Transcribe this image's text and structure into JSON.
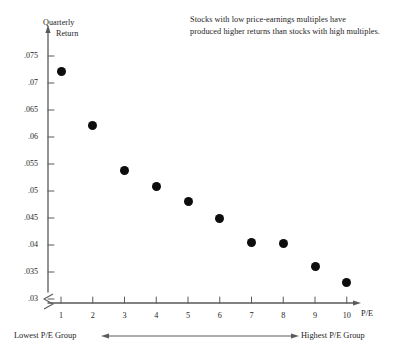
{
  "chart_data": {
    "type": "scatter",
    "title": "",
    "annotation": [
      "Stocks with low price-earnings multiples have",
      "produced higher returns than stocks with high multiples."
    ],
    "xlabel": "P/E",
    "ylabel_lines": [
      "Quarterly",
      "Return"
    ],
    "xlim": [
      0.4,
      10.8
    ],
    "ylim": [
      0.03,
      0.0775
    ],
    "yaxis_break": true,
    "grid": false,
    "legend": null,
    "xticks": [
      1,
      2,
      3,
      4,
      5,
      6,
      7,
      8,
      9,
      10
    ],
    "xtick_labels": [
      "1",
      "2",
      "3",
      "4",
      "5",
      "6",
      "7",
      "8",
      "9",
      "10"
    ],
    "yticks": [
      0.075,
      0.07,
      0.065,
      0.06,
      0.055,
      0.05,
      0.045,
      0.04,
      0.035,
      0.03
    ],
    "ytick_labels": [
      ".075",
      ".07",
      ".065",
      ".06",
      ".055",
      ".05",
      ".045",
      ".04",
      ".035",
      ".03"
    ],
    "x": [
      1,
      2,
      3,
      4,
      5,
      6,
      7,
      8,
      9,
      10
    ],
    "values": [
      0.0722,
      0.0621,
      0.0538,
      0.0509,
      0.0481,
      0.045,
      0.0404,
      0.0403,
      0.036,
      0.033
    ],
    "points": [
      {
        "x": 1,
        "y": 0.0722
      },
      {
        "x": 2,
        "y": 0.0621
      },
      {
        "x": 3,
        "y": 0.0538
      },
      {
        "x": 4,
        "y": 0.0509
      },
      {
        "x": 5,
        "y": 0.0481
      },
      {
        "x": 6,
        "y": 0.045
      },
      {
        "x": 7,
        "y": 0.0404
      },
      {
        "x": 8,
        "y": 0.0403
      },
      {
        "x": 9,
        "y": 0.036
      },
      {
        "x": 10,
        "y": 0.033
      }
    ],
    "range_labels": {
      "low": "Lowest P/E Group",
      "high": "Highest P/E Group"
    },
    "colors": {
      "marker": "#0d0d0d",
      "axis": "#5a5a5a",
      "text": "#1e1e1e",
      "background": "#ffffff"
    }
  }
}
